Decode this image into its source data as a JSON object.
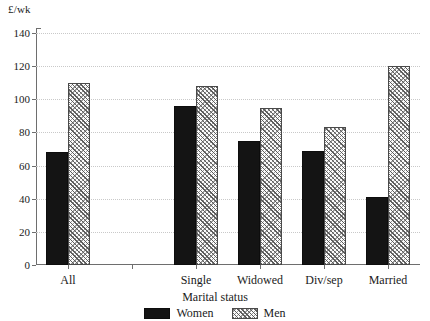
{
  "chart_data": {
    "type": "bar",
    "title": "",
    "xlabel": "Marital status",
    "ylabel": "£/wk",
    "ylim": [
      0,
      140
    ],
    "ytick_step": 20,
    "yticks": [
      "0",
      "20",
      "40",
      "60",
      "80",
      "100",
      "120",
      "140"
    ],
    "grid": true,
    "legend_position": "bottom",
    "categories": [
      "All",
      "",
      "Single",
      "Widowed",
      "Div/sep",
      "Married"
    ],
    "series": [
      {
        "name": "Women",
        "color": "#141414",
        "values": [
          68,
          null,
          96,
          75,
          69,
          41
        ]
      },
      {
        "name": "Men",
        "color": "#fbfbfb",
        "values": [
          110,
          null,
          108,
          95,
          83,
          120
        ]
      }
    ]
  },
  "axis": {
    "y_unit_label": "£/wk",
    "x_title": "Marital status"
  },
  "legend": {
    "women_label": "Women",
    "men_label": "Men"
  }
}
